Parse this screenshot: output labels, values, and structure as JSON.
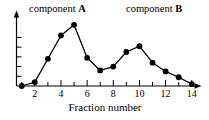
{
  "chart_data": {
    "type": "line",
    "title": "",
    "xlabel": "Fraction number",
    "ylabel": "",
    "x": [
      1,
      2,
      3,
      4,
      5,
      6,
      7,
      8,
      9,
      10,
      11,
      12,
      13,
      14
    ],
    "values": [
      0.0,
      0.4,
      2.8,
      5.2,
      6.3,
      2.9,
      1.6,
      2.0,
      3.5,
      4.1,
      2.4,
      1.5,
      0.9,
      0.2
    ],
    "series": [
      {
        "name": "elution profile",
        "values": [
          0.0,
          0.4,
          2.8,
          5.2,
          6.3,
          2.9,
          1.6,
          2.0,
          3.5,
          4.1,
          2.4,
          1.5,
          0.9,
          0.2
        ]
      }
    ],
    "xlim": [
      0.6,
      14.4
    ],
    "ylim": [
      0,
      7
    ],
    "xticks": [
      2,
      4,
      6,
      8,
      10,
      12,
      14
    ],
    "xtick_labels": [
      "2",
      "4",
      "6",
      "8",
      "10",
      "12",
      "14"
    ],
    "yticks": [
      1,
      2,
      3,
      4,
      5
    ],
    "ytick_labels": [
      "",
      "",
      "",
      "",
      ""
    ],
    "grid": false,
    "legend": false,
    "marker": "filled-circle",
    "line_color": "#000000",
    "marker_color": "#000000",
    "annotations": [
      {
        "id": "component-a",
        "text_prefix": "component ",
        "text_bold": "A",
        "peak_x": 5
      },
      {
        "id": "component-b",
        "text_prefix": "component ",
        "text_bold": "B",
        "peak_x": 10
      }
    ]
  },
  "labels": {
    "component_a_prefix": "component ",
    "component_a_bold": "A",
    "component_b_prefix": "component ",
    "component_b_bold": "B",
    "x_axis_title": "Fraction number"
  }
}
